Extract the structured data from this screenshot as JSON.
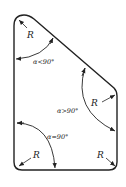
{
  "diagram": {
    "type": "corner-radius-angle-diagram",
    "stroke_color": "#222222",
    "background": "#ffffff",
    "labels": {
      "r_top_left": "R",
      "angle_acute": "α<90°",
      "r_right": "R",
      "angle_obtuse": "α>90°",
      "angle_right": "α=90°",
      "r_bottom_left": "R",
      "r_bottom_right": "R"
    }
  }
}
